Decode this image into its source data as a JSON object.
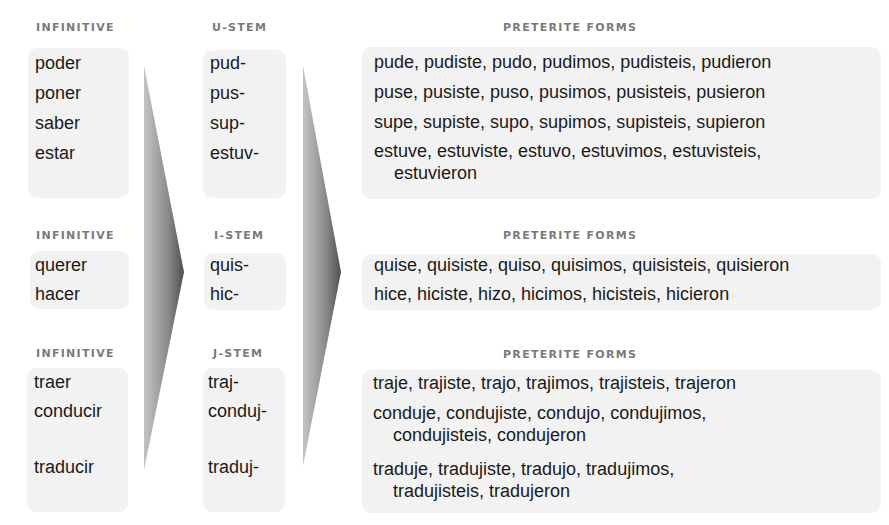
{
  "header_fragment": "g  ,  ,  ",
  "colors": {
    "box_bg": "#f2f2f2",
    "label": "#7a7a7a",
    "text": "#1a1a1a",
    "arrow_light": "#bdbdbd",
    "arrow_dark": "#555555"
  },
  "groups": [
    {
      "infinitive_label": "INFINITIVE",
      "stem_label": "U-STEM",
      "forms_label": "PRETERITE FORMS",
      "infinitives": [
        "poder",
        "poner",
        "saber",
        "estar"
      ],
      "stems": [
        "pud-",
        "pus-",
        "sup-",
        "estuv-"
      ],
      "forms": [
        [
          "pude, pudiste, pudo, pudimos, pudisteis, pudieron"
        ],
        [
          "puse, pusiste, puso, pusimos, pusisteis, pusieron"
        ],
        [
          "supe, supiste, supo, supimos, supisteis, supieron"
        ],
        [
          "estuve, estuviste, estuvo, estuvimos, estuvisteis,",
          "estuvieron"
        ]
      ]
    },
    {
      "infinitive_label": "INFINITIVE",
      "stem_label": "I-STEM",
      "forms_label": "PRETERITE FORMS",
      "infinitives": [
        "querer",
        "hacer"
      ],
      "stems": [
        "quis-",
        "hic-"
      ],
      "forms": [
        [
          "quise, quisiste, quiso, quisimos, quisisteis, quisieron"
        ],
        [
          "hice, hiciste, hizo, hicimos, hicisteis, hicieron"
        ]
      ]
    },
    {
      "infinitive_label": "INFINITIVE",
      "stem_label": "J-STEM",
      "forms_label": "PRETERITE FORMS",
      "infinitives": [
        "traer",
        "conducir",
        "traducir"
      ],
      "stems": [
        "traj-",
        "conduj-",
        "traduj-"
      ],
      "forms": [
        [
          "traje, trajiste, trajo, trajimos, trajisteis, trajeron"
        ],
        [
          "conduje, condujiste, condujo, condujimos,",
          "condujisteis, condujeron"
        ],
        [
          "traduje, tradujiste, tradujo, tradujimos,",
          "tradujisteis, tradujeron"
        ]
      ]
    }
  ]
}
